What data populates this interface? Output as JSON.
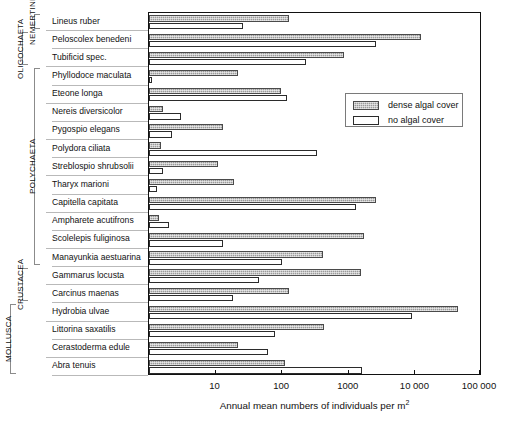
{
  "chart_data": {
    "type": "bar",
    "orientation": "horizontal",
    "xscale": "log",
    "title": "",
    "xlabel": "Annual mean numbers of individuals  per m ²",
    "ylabel": "",
    "xlim": [
      1,
      100000
    ],
    "xticks": [
      10,
      100,
      1000,
      10000,
      100000
    ],
    "xticklabels": [
      "10",
      "100",
      "1000",
      "10 000",
      "100 000"
    ],
    "grid": false,
    "legend_position": "upper-right-inside",
    "legend": [
      "dense algal cover",
      "no algal cover"
    ],
    "series": [
      {
        "name": "dense algal cover",
        "color": "#9a9a9a",
        "pattern": "dotted-hatch",
        "values": [
          125,
          12000,
          850,
          22,
          95,
          1.6,
          13,
          1.5,
          11,
          19,
          2600,
          1.4,
          1700,
          410,
          1500,
          125,
          43000,
          430,
          22,
          110
        ]
      },
      {
        "name": "no algal cover",
        "color": "#ffffff",
        "pattern": "open",
        "values": [
          26,
          2600,
          230,
          1.1,
          120,
          3.0,
          2.2,
          330,
          1.6,
          1.3,
          1300,
          2.0,
          13,
          100,
          45,
          18,
          9000,
          78,
          62,
          1600
        ]
      }
    ],
    "categories": [
      "Lineus ruber",
      "Peloscolex benedeni",
      "Tubificid spec.",
      "Phyllodoce maculata",
      "Eteone longa",
      "Nereis diversicolor",
      "Pygospio elegans",
      "Polydora ciliata",
      "Streblospio shrubsolii",
      "Tharyx marioni",
      "Capitella capitata",
      "Ampharete acutifrons",
      "Scolelepis fuliginosa",
      "Manayunkia aestuarina",
      "Gammarus locusta",
      "Carcinus maenas",
      "Hydrobia ulvae",
      "Littorina saxatilis",
      "Cerastoderma edule",
      "Abra tenuis"
    ]
  },
  "axis": {
    "x_title": "Annual mean numbers of individuals  per m ²",
    "x_title_main": "Annual mean numbers of individuals  per m",
    "x_title_sup": "2",
    "tick_labels": [
      "10",
      "100",
      "1000",
      "10 000",
      "100 000"
    ]
  },
  "legend": {
    "entries": [
      {
        "label": "dense algal cover",
        "style": "dense"
      },
      {
        "label": "no algal cover",
        "style": "none"
      }
    ]
  },
  "species": [
    {
      "name": "Lineus ruber",
      "dense": 125,
      "none": 26
    },
    {
      "name": "Peloscolex benedeni",
      "dense": 12000,
      "none": 2600
    },
    {
      "name": "Tubificid spec.",
      "dense": 850,
      "none": 230
    },
    {
      "name": "Phyllodoce maculata",
      "dense": 22,
      "none": 1.1
    },
    {
      "name": "Eteone longa",
      "dense": 95,
      "none": 120
    },
    {
      "name": "Nereis diversicolor",
      "dense": 1.6,
      "none": 3.0
    },
    {
      "name": "Pygospio elegans",
      "dense": 13,
      "none": 2.2
    },
    {
      "name": "Polydora ciliata",
      "dense": 1.5,
      "none": 330
    },
    {
      "name": "Streblospio shrubsolii",
      "dense": 11,
      "none": 1.6
    },
    {
      "name": "Tharyx marioni",
      "dense": 19,
      "none": 1.3
    },
    {
      "name": "Capitella capitata",
      "dense": 2600,
      "none": 1300
    },
    {
      "name": "Ampharete acutifrons",
      "dense": 1.4,
      "none": 2.0
    },
    {
      "name": "Scolelepis fuliginosa",
      "dense": 1700,
      "none": 13
    },
    {
      "name": "Manayunkia aestuarina",
      "dense": 410,
      "none": 100
    },
    {
      "name": "Gammarus locusta",
      "dense": 1500,
      "none": 45
    },
    {
      "name": "Carcinus maenas",
      "dense": 125,
      "none": 18
    },
    {
      "name": "Hydrobia ulvae",
      "dense": 43000,
      "none": 9000
    },
    {
      "name": "Littorina saxatilis",
      "dense": 430,
      "none": 78
    },
    {
      "name": "Cerastoderma edule",
      "dense": 22,
      "none": 62
    },
    {
      "name": "Abra tenuis",
      "dense": 110,
      "none": 1600
    }
  ],
  "groups": [
    {
      "label": "NEMERTINI",
      "first": 0,
      "last": 0
    },
    {
      "label": "OLIGOCHAETA",
      "first": 1,
      "last": 2
    },
    {
      "label": "POLYCHAETA",
      "first": 3,
      "last": 13
    },
    {
      "label": "CRUSTACEA",
      "first": 14,
      "last": 15
    },
    {
      "label": "MOLLUSCA",
      "first": 16,
      "last": 19
    }
  ]
}
